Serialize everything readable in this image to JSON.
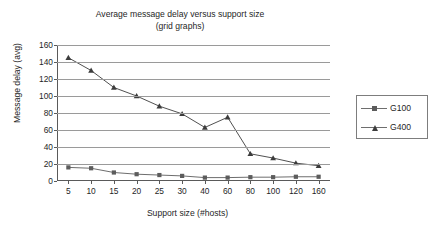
{
  "chart_data": {
    "type": "line",
    "title": "Average message delay versus support size",
    "subtitle": "(grid graphs)",
    "xlabel": "Support size (#hosts)",
    "ylabel": "Message delay (avg)",
    "categories": [
      "5",
      "10",
      "15",
      "20",
      "25",
      "30",
      "40",
      "60",
      "80",
      "100",
      "120",
      "160"
    ],
    "yticks": [
      "0",
      "20",
      "40",
      "60",
      "80",
      "100",
      "120",
      "140",
      "160"
    ],
    "ylim": [
      0,
      160
    ],
    "grid": true,
    "legend_position": "right",
    "series": [
      {
        "name": "G100",
        "marker": "square",
        "color": "#5c5c5c",
        "values": [
          16,
          15,
          10,
          8,
          7,
          6,
          4,
          4,
          4.5,
          4.5,
          5,
          5
        ]
      },
      {
        "name": "G400",
        "marker": "triangle",
        "color": "#3c3c3c",
        "values": [
          145,
          130,
          110,
          100,
          88,
          79,
          63,
          75,
          32,
          27,
          21,
          18
        ]
      }
    ]
  }
}
